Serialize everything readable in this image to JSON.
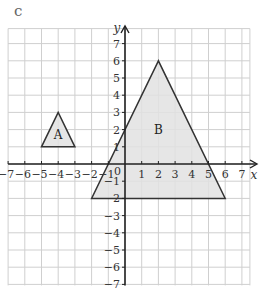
{
  "part_label": "c",
  "axes": {
    "x_label": "x",
    "y_label": "y",
    "x_range": [
      -7,
      7
    ],
    "y_range": [
      -7,
      7
    ],
    "origin_label": "0",
    "x_ticks": [
      -7,
      -6,
      -5,
      -4,
      -3,
      -2,
      -1,
      1,
      2,
      3,
      4,
      5,
      6,
      7
    ],
    "y_ticks": [
      7,
      6,
      5,
      4,
      3,
      2,
      1,
      -1,
      -2,
      -3,
      -4,
      -5,
      -6,
      -7
    ]
  },
  "shapes": [
    {
      "label": "A",
      "vertices": [
        [
          -4,
          3
        ],
        [
          -5,
          1
        ],
        [
          -3,
          1
        ]
      ],
      "label_pos": [
        -4,
        1.7
      ],
      "fill": "#e2e2e2",
      "stroke": "#333333"
    },
    {
      "label": "B",
      "vertices": [
        [
          2,
          6
        ],
        [
          -2,
          -2
        ],
        [
          6,
          -2
        ]
      ],
      "label_pos": [
        2,
        2
      ],
      "fill": "#e2e2e2",
      "stroke": "#333333"
    }
  ],
  "colors": {
    "grid": "#cfcfcf",
    "axis": "#222222",
    "text": "#333333"
  }
}
